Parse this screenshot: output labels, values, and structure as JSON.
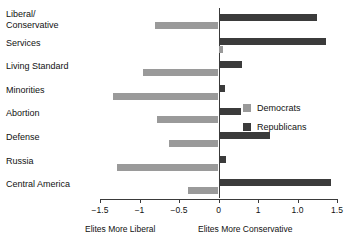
{
  "chart_data": {
    "type": "bar",
    "orientation": "horizontal",
    "title": "",
    "xlabel": "",
    "ylabel": "",
    "xlim": [
      -1.5,
      1.5
    ],
    "grid": false,
    "legend_position": "right",
    "categories": [
      "Liberal/\nConservative",
      "Services",
      "Living Standard",
      "Minorities",
      "Abortion",
      "Defense",
      "Russia",
      "Central America"
    ],
    "tick_values": [
      -1.5,
      -1,
      -0.5,
      0,
      0.5,
      1.0,
      1.5
    ],
    "tick_labels": [
      "−1.5",
      "−1",
      "−0.5",
      "0",
      "1",
      "1.0",
      "1.5"
    ],
    "axis_captions": {
      "left": "Elites More Liberal",
      "right": "Elites More Conservative"
    },
    "series": [
      {
        "name": "Democrats",
        "color": "#9a9a9a",
        "values": [
          -0.8,
          0.06,
          -0.95,
          -1.33,
          -0.78,
          -0.63,
          -1.28,
          -0.38
        ]
      },
      {
        "name": "Republicans",
        "color": "#3b3b3b",
        "values": [
          1.25,
          1.36,
          0.3,
          0.08,
          0.28,
          0.65,
          0.1,
          1.42
        ]
      }
    ]
  },
  "legend": {
    "items": [
      {
        "label": "Democrats",
        "color": "#9a9a9a"
      },
      {
        "label": "Republicans",
        "color": "#3b3b3b"
      }
    ]
  }
}
